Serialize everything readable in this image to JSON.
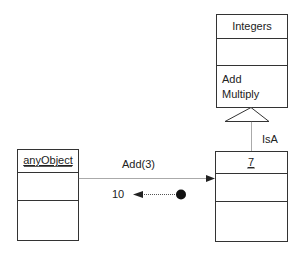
{
  "diagram": {
    "classes": [
      {
        "id": "integers",
        "name": "Integers",
        "underlined": false,
        "attributes": [],
        "operations": [
          "Add",
          "Multiply"
        ]
      },
      {
        "id": "seven",
        "name": "7",
        "underlined": true,
        "attributes": [],
        "operations": []
      },
      {
        "id": "anyObject",
        "name": "anyObject",
        "underlined": true,
        "attributes": [],
        "operations": []
      }
    ],
    "relations": {
      "inheritance_label": "IsA",
      "message_label": "Add(3)",
      "return_label": "10"
    },
    "colors": {
      "line": "#333333",
      "background": "#ffffff"
    }
  }
}
